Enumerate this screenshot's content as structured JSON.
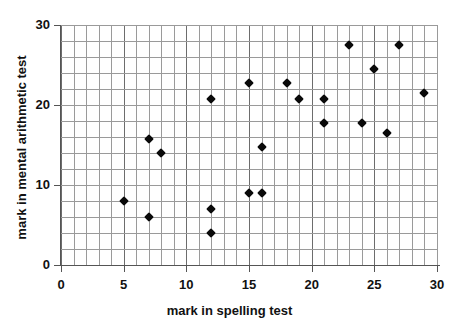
{
  "chart_data": {
    "type": "scatter",
    "title": "",
    "xlabel": "mark in spelling test",
    "ylabel": "mark in mental arithmetic test",
    "xlim": [
      0,
      30
    ],
    "ylim": [
      0,
      30
    ],
    "x_ticks": [
      0,
      5,
      10,
      15,
      20,
      25,
      30
    ],
    "y_ticks": [
      0,
      10,
      20,
      30
    ],
    "x_tick_labels": [
      "0",
      "5",
      "10",
      "15",
      "20",
      "25",
      "30"
    ],
    "y_tick_labels": [
      "0",
      "10",
      "20",
      "30"
    ],
    "grid": true,
    "x_gridline_step": 1,
    "y_gridline_step": 2,
    "legend": "none",
    "marker": "diamond",
    "marker_color": "#0a0a0a",
    "points": [
      {
        "x": 5,
        "y": 8
      },
      {
        "x": 7,
        "y": 6
      },
      {
        "x": 7,
        "y": 15.75
      },
      {
        "x": 8,
        "y": 14
      },
      {
        "x": 12,
        "y": 4
      },
      {
        "x": 12,
        "y": 7
      },
      {
        "x": 12,
        "y": 20.75
      },
      {
        "x": 15,
        "y": 9
      },
      {
        "x": 15,
        "y": 22.75
      },
      {
        "x": 16,
        "y": 9
      },
      {
        "x": 16,
        "y": 14.75
      },
      {
        "x": 18,
        "y": 22.75
      },
      {
        "x": 19,
        "y": 20.75
      },
      {
        "x": 21,
        "y": 17.75
      },
      {
        "x": 21,
        "y": 20.75
      },
      {
        "x": 23,
        "y": 27.5
      },
      {
        "x": 24,
        "y": 17.75
      },
      {
        "x": 25,
        "y": 24.5
      },
      {
        "x": 26,
        "y": 16.5
      },
      {
        "x": 27,
        "y": 27.5
      },
      {
        "x": 29,
        "y": 21.5
      }
    ]
  }
}
